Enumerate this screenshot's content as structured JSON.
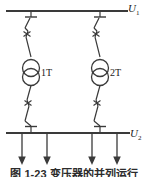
{
  "figure": {
    "type": "single-line-electrical-diagram",
    "caption": "图 1-23  变压器的并列运行",
    "background_color": "#ffffff",
    "line_color": "#3a3a3a"
  },
  "buses": [
    {
      "id": "upper-bus",
      "label": "U",
      "subscript": "1",
      "role": "high-voltage-busbar",
      "y": 11,
      "x_start": 6,
      "x_end": 128
    },
    {
      "id": "lower-bus",
      "label": "U",
      "subscript": "2",
      "role": "low-voltage-busbar",
      "y": 133,
      "x_start": 6,
      "x_end": 130
    }
  ],
  "branches": [
    {
      "id": "branch-1",
      "x": 31,
      "transformer_label": "1T",
      "components": [
        "disconnector-upper",
        "circuit-breaker-upper",
        "transformer",
        "circuit-breaker-lower",
        "disconnector-lower"
      ]
    },
    {
      "id": "branch-2",
      "x": 100,
      "transformer_label": "2T",
      "components": [
        "disconnector-upper",
        "circuit-breaker-upper",
        "transformer",
        "circuit-breaker-lower",
        "disconnector-lower"
      ]
    }
  ],
  "feeders": [
    {
      "id": "feeder-1",
      "x": 22
    },
    {
      "id": "feeder-2",
      "x": 47
    },
    {
      "id": "feeder-3",
      "x": 92
    },
    {
      "id": "feeder-4",
      "x": 117
    }
  ],
  "icons": {
    "transformer": "two-winding-transformer-icon",
    "breaker": "circuit-breaker-icon",
    "disconnector": "disconnector-switch-icon",
    "feeder_arrow": "down-arrow-icon"
  }
}
